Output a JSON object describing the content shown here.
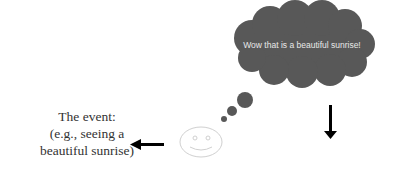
{
  "diagram": {
    "thought_bubble": {
      "text": "Wow that is a beautiful sunrise!",
      "fill": "#585858"
    },
    "event_label": {
      "line1": "The event:",
      "line2": "(e.g., seeing a",
      "line3": "beautiful sunrise)"
    },
    "smiley": {
      "stroke": "#d0d0d0"
    },
    "arrows": [
      {
        "direction": "left",
        "color": "#000000"
      },
      {
        "direction": "down",
        "color": "#000000"
      }
    ]
  }
}
